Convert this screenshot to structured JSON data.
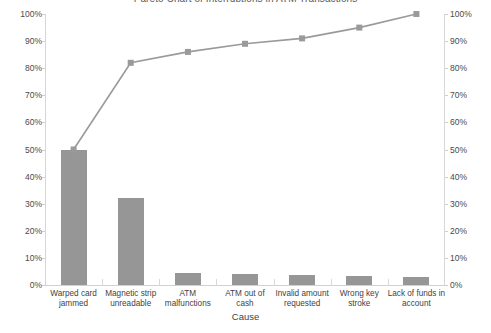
{
  "chart_data": {
    "type": "bar",
    "title": "Pareto Chart of Interruptions in ATM Transactions",
    "xlabel": "Cause",
    "ylabel": "",
    "categories": [
      "Warped card jammed",
      "Magnetic strip unreadable",
      "ATM malfunctions",
      "ATM out of cash",
      "Invalid amount requested",
      "Wrong key stroke",
      "Lack of funds in account"
    ],
    "category_lines": [
      [
        "Warped card",
        "jammed"
      ],
      [
        "Magnetic strip",
        "unreadable"
      ],
      [
        "ATM",
        "malfunctions"
      ],
      [
        "ATM out of",
        "cash"
      ],
      [
        "Invalid amount",
        "requested"
      ],
      [
        "Wrong key",
        "stroke"
      ],
      [
        "Lack of funds in",
        "account"
      ]
    ],
    "series": [
      {
        "name": "Percent",
        "chart_type": "bar",
        "values": [
          50,
          32,
          4.3,
          4.0,
          3.8,
          3.5,
          3.0
        ],
        "color": "#969696"
      },
      {
        "name": "Cumulative Percent",
        "chart_type": "line",
        "values": [
          50,
          82,
          86,
          89,
          91,
          95,
          100
        ],
        "color": "#9a9a9a"
      }
    ],
    "ylim": [
      0,
      100
    ],
    "y2lim": [
      0,
      100
    ],
    "ytick_labels": [
      "100%",
      "90%",
      "80%",
      "70%",
      "60%",
      "50%",
      "40%",
      "30%",
      "20%",
      "10%",
      "0%"
    ],
    "ytick_values": [
      100,
      90,
      80,
      70,
      60,
      50,
      40,
      30,
      20,
      10,
      0
    ],
    "y2tick_labels": [
      "100%",
      "90%",
      "80%",
      "70%",
      "60%",
      "50%",
      "40%",
      "30%",
      "20%",
      "10%",
      "0%"
    ],
    "y2tick_values": [
      100,
      90,
      80,
      70,
      60,
      50,
      40,
      30,
      20,
      10,
      0
    ],
    "grid": false,
    "legend": "none"
  }
}
